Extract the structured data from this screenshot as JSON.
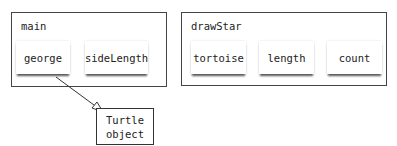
{
  "frames": [
    {
      "name": "main",
      "variables": [
        "george",
        "sideLength"
      ]
    },
    {
      "name": "drawStar",
      "variables": [
        "tortoise",
        "length",
        "count"
      ]
    }
  ],
  "objects": [
    {
      "line1": "Turtle",
      "line2": "object"
    }
  ],
  "references": [
    {
      "from": "main.george",
      "to": "Turtle object"
    }
  ]
}
